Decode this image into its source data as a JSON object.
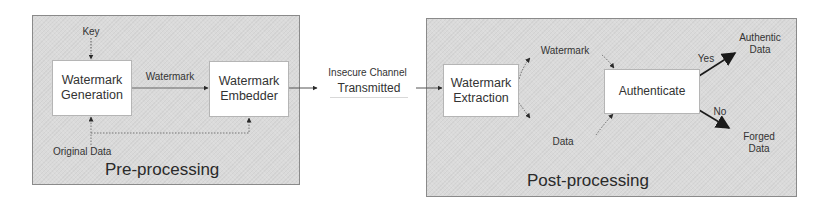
{
  "pre_processing": {
    "title": "Pre-processing",
    "key_label": "Key",
    "original_data_label": "Original Data",
    "watermark_arrow_label": "Watermark",
    "generation_box": {
      "line1": "Watermark",
      "line2": "Generation"
    },
    "embedder_box": {
      "line1": "Watermark",
      "line2": "Embedder"
    }
  },
  "channel": {
    "insecure_label": "Insecure Channel",
    "transmitted_label": "Transmitted"
  },
  "post_processing": {
    "title": "Post-processing",
    "extraction_box": {
      "line1": "Watermark",
      "line2": "Extraction"
    },
    "watermark_label": "Watermark",
    "data_label": "Data",
    "authenticate_box": {
      "label": "Authenticate"
    },
    "yes_label": "Yes",
    "no_label": "No",
    "authentic_output": {
      "line1": "Authentic",
      "line2": "Data"
    },
    "forged_output": {
      "line1": "Forged",
      "line2": "Data"
    }
  },
  "colors": {
    "panel_bg": "#dadada",
    "panel_border": "#8a8a8a",
    "box_bg": "#ffffff",
    "arrow": "#2a2a2a"
  }
}
